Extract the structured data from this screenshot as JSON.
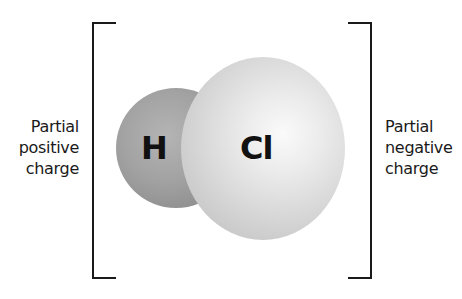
{
  "diagram": {
    "left_label": {
      "lines": [
        "Partial",
        "positive",
        "charge"
      ]
    },
    "right_label": {
      "lines": [
        "Partial",
        "negative",
        "charge"
      ]
    },
    "atoms": [
      {
        "symbol": "H",
        "role": "smaller atom, partial positive",
        "color": "#a2a2a2"
      },
      {
        "symbol": "Cl",
        "role": "larger atom, partial negative",
        "color": "#e0e0e0"
      }
    ],
    "colors": {
      "bracket": "#1a1a1a",
      "text": "#1a1a1a",
      "background": "#ffffff"
    }
  }
}
